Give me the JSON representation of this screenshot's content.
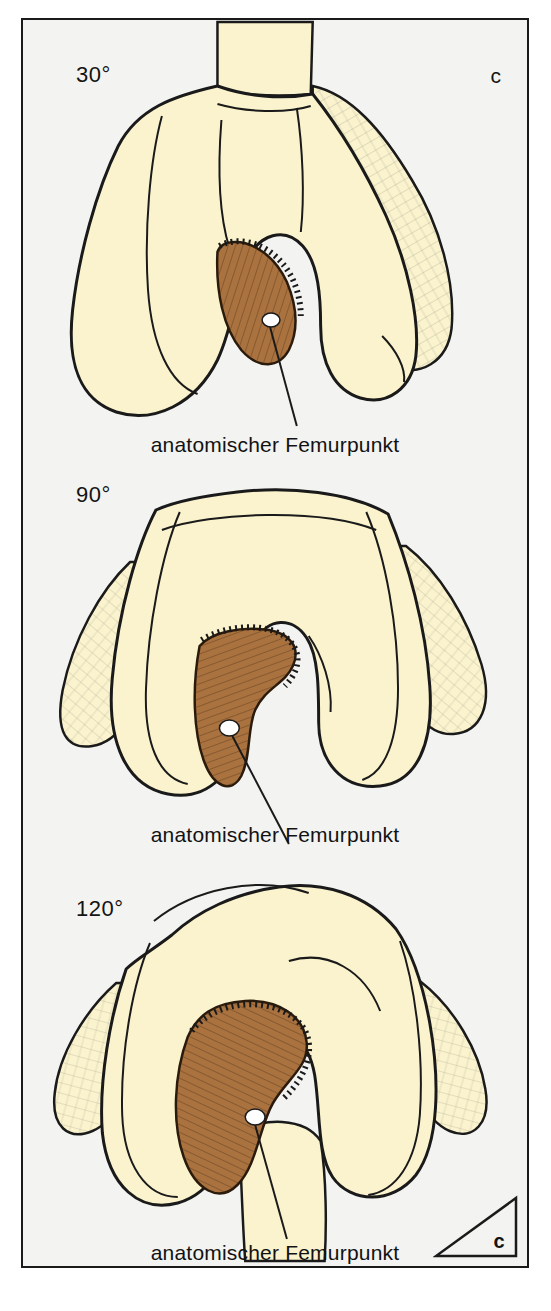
{
  "figure": {
    "background_color": "#f3f3f1",
    "bone_color": "#faf3ce",
    "cartilage_color": "#a9723f",
    "outline_color": "#1a1a1a",
    "marker_color": "#ffffff",
    "corner_label": "c",
    "corner_triangle_label": "c"
  },
  "panels": [
    {
      "angle": "30°",
      "caption": "anatomischer Femurpunkt",
      "marker_name": "anatomical-femur-point"
    },
    {
      "angle": "90°",
      "caption": "anatomischer Femurpunkt",
      "marker_name": "anatomical-femur-point"
    },
    {
      "angle": "120°",
      "caption": "anatomischer Femurpunkt",
      "marker_name": "anatomical-femur-point"
    }
  ]
}
